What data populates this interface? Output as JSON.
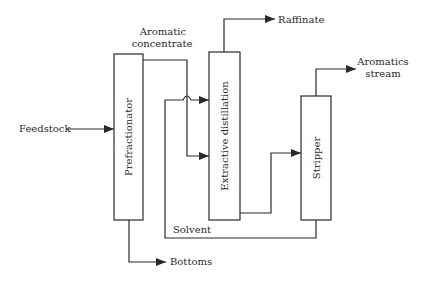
{
  "diagram": {
    "type": "process-flow",
    "units": {
      "prefractionator": "Prefractionator",
      "extractive": "Extractive distillation",
      "stripper": "Stripper"
    },
    "streams": {
      "feedstock": "Feedstock",
      "aromatic_line1": "Aromatic",
      "aromatic_line2": "concentrate",
      "raffinate": "Raffinate",
      "aromatics_line1": "Aromatics",
      "aromatics_line2": "stream",
      "solvent": "Solvent",
      "bottoms": "Bottoms"
    },
    "colors": {
      "line": "#2a2a2a",
      "background": "#ffffff"
    }
  }
}
